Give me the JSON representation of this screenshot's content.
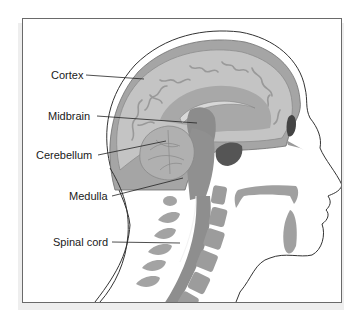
{
  "diagram": {
    "type": "anatomical-cross-section",
    "labels": [
      {
        "id": "cortex",
        "text": "Cortex"
      },
      {
        "id": "midbrain",
        "text": "Midbrain"
      },
      {
        "id": "cerebellum",
        "text": "Cerebellum"
      },
      {
        "id": "medulla",
        "text": "Medulla"
      },
      {
        "id": "spinal-cord",
        "text": "Spinal cord"
      }
    ],
    "colors": {
      "outline": "#333333",
      "skull": "#9a9a9a",
      "brain_light": "#c4c4c4",
      "brain_mid": "#a8a8a8",
      "brain_dark": "#8c8c8c",
      "cavity_dark": "#555555",
      "frame_border": "#6a6a6a"
    }
  }
}
